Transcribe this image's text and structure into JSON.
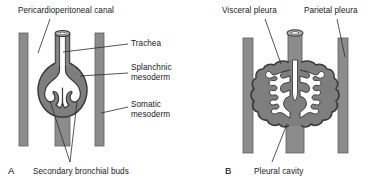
{
  "figure": {
    "width": 380,
    "height": 184,
    "background_color": "#ffffff"
  },
  "colors": {
    "body_wall_gray": "#8c8c8c",
    "body_wall_stroke": "#6e6e6e",
    "mesoderm_gray": "#7e7e7e",
    "lung_fill_white": "#ffffff",
    "outline_dark": "#3a3a3a",
    "text": "#1a1a1a",
    "leader_line": "#2b2b2b"
  },
  "panels": [
    {
      "id": "A",
      "letter": "A",
      "labels": [
        {
          "name": "pericardioperitoneal-canal",
          "text": "Pericardioperitoneal canal",
          "x": 18,
          "y": 6
        },
        {
          "name": "trachea",
          "text": "Trachea",
          "x": 130,
          "y": 40
        },
        {
          "name": "splanchnic-mesoderm",
          "text": "Splanchnic\nmesoderm",
          "x": 130,
          "y": 65
        },
        {
          "name": "somatic-mesoderm",
          "text": "Somatic\nmesoderm",
          "x": 130,
          "y": 101
        },
        {
          "name": "secondary-bronchial-buds",
          "text": "Secondary bronchial buds",
          "x": 33,
          "y": 168
        }
      ]
    },
    {
      "id": "B",
      "letter": "B",
      "labels": [
        {
          "name": "visceral-pleura",
          "text": "Visceral pleura",
          "x": 221,
          "y": 6
        },
        {
          "name": "parietal-pleura",
          "text": "Parietal pleura",
          "x": 305,
          "y": 6
        },
        {
          "name": "pleural-cavity",
          "text": "Pleural cavity",
          "x": 255,
          "y": 168
        }
      ]
    }
  ],
  "structures": {
    "panel_a": {
      "body_wall_left": "somatic mesoderm body wall bar",
      "body_wall_right": "somatic mesoderm body wall bar",
      "trachea": "tracheal tube with ring opening",
      "lung_bud_mass": "splanchnic mesoderm covered lung bud",
      "secondary_buds": "secondary bronchial buds"
    },
    "panel_b": {
      "body_wall_left": "parietal pleura lined body wall bar",
      "body_wall_right": "parietal pleura lined body wall bar",
      "trachea": "tracheal tube with ring opening",
      "lung_mass": "branched developing lungs covered by visceral pleura",
      "pleural_cavity": "pleural cavity space"
    }
  }
}
